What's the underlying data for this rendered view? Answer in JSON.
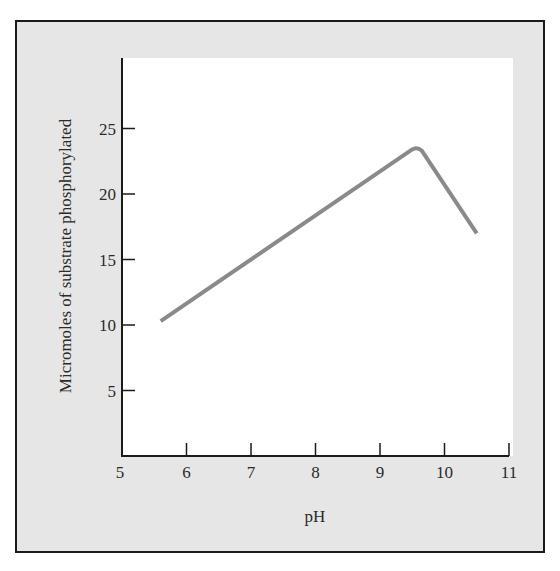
{
  "chart_data": {
    "type": "line",
    "title": "",
    "xlabel": "pH",
    "ylabel": "Micromoles of substrate phosphorylated",
    "xlim": [
      5,
      11
    ],
    "ylim": [
      0,
      28
    ],
    "xticks": [
      "5",
      "6",
      "7",
      "8",
      "9",
      "10",
      "11"
    ],
    "yticks": [
      "5",
      "10",
      "15",
      "20",
      "25"
    ],
    "grid": false,
    "legend": null,
    "series": [
      {
        "name": "Phosphorylation activity",
        "color": "#8a8a8a",
        "x": [
          5.6,
          9.5,
          9.65,
          10.5
        ],
        "y": [
          10.3,
          23.4,
          23.3,
          17.0
        ]
      }
    ],
    "annotations": []
  },
  "colors": {
    "frame_background": "#e6e6e6",
    "plot_background": "#ffffff",
    "axis": "#1a1a1a",
    "curve": "#8a8a8a"
  }
}
